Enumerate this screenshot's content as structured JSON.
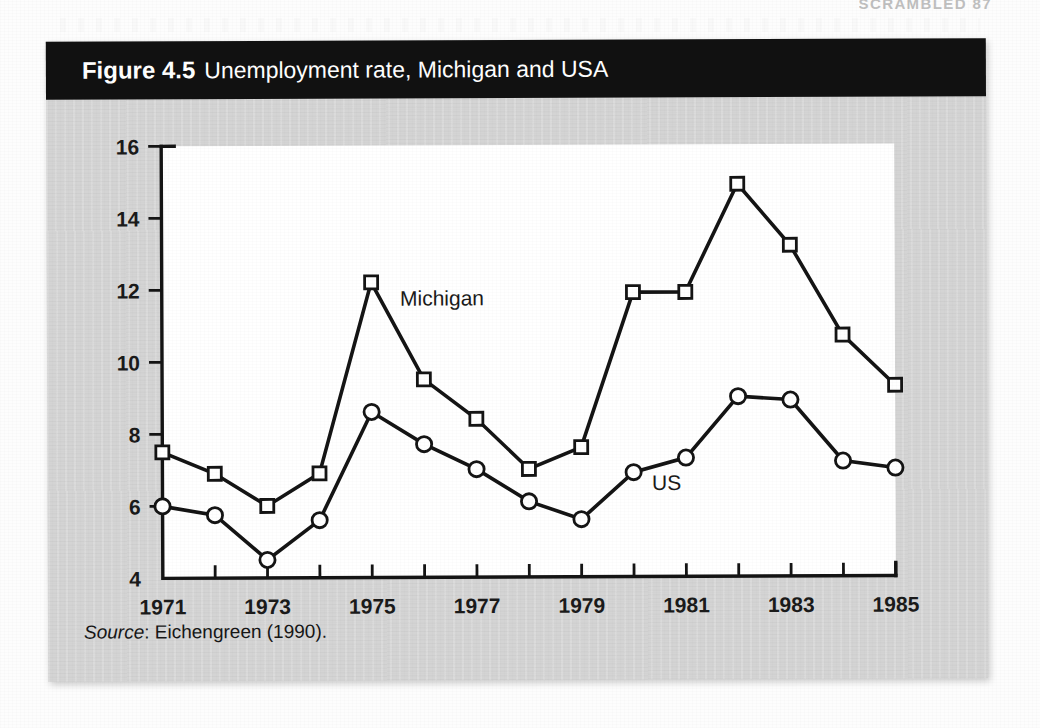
{
  "page": {
    "running_head": "SCRAMBLED  87"
  },
  "figure": {
    "number": "Figure 4.5",
    "title": "Unemployment rate, Michigan and USA",
    "source_label": "Source",
    "source_text": ": Eichengreen (1990)."
  },
  "chart_data": {
    "type": "line",
    "title": "Unemployment rate, Michigan and USA",
    "xlabel": "",
    "ylabel": "",
    "x": [
      1971,
      1972,
      1973,
      1974,
      1975,
      1976,
      1977,
      1978,
      1979,
      1980,
      1981,
      1982,
      1983,
      1984,
      1985
    ],
    "xlim": [
      1971,
      1985
    ],
    "ylim": [
      4,
      16
    ],
    "ytick_labels": [
      "4",
      "6",
      "8",
      "10",
      "12",
      "14",
      "16"
    ],
    "yticks": [
      4,
      6,
      8,
      10,
      12,
      14,
      16
    ],
    "xtick_labels": [
      "1971",
      "1973",
      "1975",
      "1977",
      "1979",
      "1981",
      "1983",
      "1985"
    ],
    "xticks_labeled": [
      1971,
      1973,
      1975,
      1977,
      1979,
      1981,
      1983,
      1985
    ],
    "xticks_minor": [
      1972,
      1974,
      1976,
      1978,
      1980,
      1982,
      1984
    ],
    "grid": false,
    "legend_position": "inline-annotations",
    "series": [
      {
        "name": "Michigan",
        "marker": "square",
        "label_x": 1975.55,
        "label_y": 11.55,
        "values": [
          7.5,
          6.9,
          6.0,
          6.9,
          12.2,
          9.5,
          8.4,
          7.0,
          7.6,
          11.9,
          11.9,
          14.9,
          13.2,
          10.7,
          9.3
        ]
      },
      {
        "name": "US",
        "marker": "circle",
        "label_x": 1980.35,
        "label_y": 6.4,
        "values": [
          6.0,
          5.75,
          4.5,
          5.6,
          8.6,
          7.7,
          7.0,
          6.1,
          5.6,
          6.9,
          7.3,
          9.0,
          8.9,
          7.2,
          7.0
        ]
      }
    ],
    "colors": {
      "line": "#141414",
      "marker_fill": "#ffffff",
      "plot_background": "#ffffff",
      "figure_background": "#d4d4d4",
      "caption_background": "#111111",
      "caption_text": "#ffffff"
    }
  }
}
